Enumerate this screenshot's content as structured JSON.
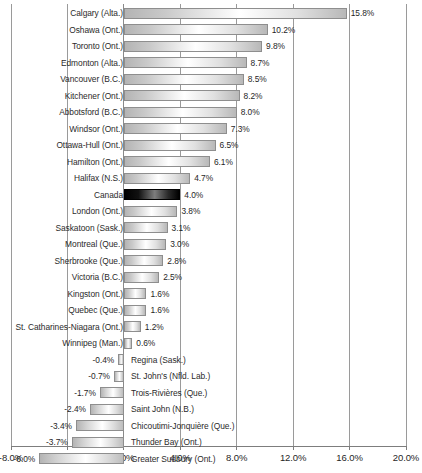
{
  "chart_data": {
    "type": "bar",
    "orientation": "horizontal",
    "title": "",
    "subtitle": "",
    "xlabel": "",
    "ylabel": "",
    "xlim": [
      -8.0,
      20.0
    ],
    "grid": true,
    "legend": null,
    "value_suffix": "%",
    "highlight_category": "Canada",
    "axis_ticks": [
      {
        "value": -8.0,
        "label": "-8.0%"
      },
      {
        "value": -4.0,
        "label": "-4.0%"
      },
      {
        "value": 0.0,
        "label": "0.0%"
      },
      {
        "value": 4.0,
        "label": "4.0%"
      },
      {
        "value": 8.0,
        "label": "8.0%"
      },
      {
        "value": 12.0,
        "label": "12.0%"
      },
      {
        "value": 16.0,
        "label": "16.0%"
      },
      {
        "value": 20.0,
        "label": "20.0%"
      }
    ],
    "categories": [
      "Calgary (Alta.)",
      "Oshawa (Ont.)",
      "Toronto (Ont.)",
      "Edmonton (Alta.)",
      "Vancouver (B.C.)",
      "Kitchener (Ont.)",
      "Abbotsford (B.C.)",
      "Windsor (Ont.)",
      "Ottawa-Hull (Ont.)",
      "Hamilton (Ont.)",
      "Halifax (N.S.)",
      "Canada",
      "London (Ont.)",
      "Saskatoon (Sask.)",
      "Montreal (Que.)",
      "Sherbrooke (Que.)",
      "Victoria (B.C.)",
      "Kingston (Ont.)",
      "Quebec (Que.)",
      "St. Catharines-Niagara (Ont.)",
      "Winnipeg (Man.)",
      "Regina (Sask.)",
      "St. John's (Nfld. Lab.)",
      "Trois-Rivières (Que.)",
      "Saint John (N.B.)",
      "Chicoutimi-Jonquière (Que.)",
      "Thunder Bay (Ont.)",
      "Greater Sudbury (Ont.)"
    ],
    "values": [
      15.8,
      10.2,
      9.8,
      8.7,
      8.5,
      8.2,
      8.0,
      7.3,
      6.5,
      6.1,
      4.7,
      4.0,
      3.8,
      3.1,
      3.0,
      2.8,
      2.5,
      1.6,
      1.6,
      1.2,
      0.6,
      -0.4,
      -0.7,
      -1.7,
      -2.4,
      -3.4,
      -3.7,
      -6.0
    ],
    "value_labels": [
      "15.8%",
      "10.2%",
      "9.8%",
      "8.7%",
      "8.5%",
      "8.2%",
      "8.0%",
      "7.3%",
      "6.5%",
      "6.1%",
      "4.7%",
      "4.0%",
      "3.8%",
      "3.1%",
      "3.0%",
      "2.8%",
      "2.5%",
      "1.6%",
      "1.6%",
      "1.2%",
      "0.6%",
      "-0.4%",
      "-0.7%",
      "-1.7%",
      "-2.4%",
      "-3.4%",
      "-3.7%",
      "-6.0%"
    ]
  },
  "colors": {
    "bar_fill_light": "#d9d9d9",
    "bar_border": "#8e8e8e",
    "bar_highlight": "#000000",
    "gridline": "#9a9a9a",
    "text": "#2b2b2b",
    "background": "#ffffff"
  }
}
